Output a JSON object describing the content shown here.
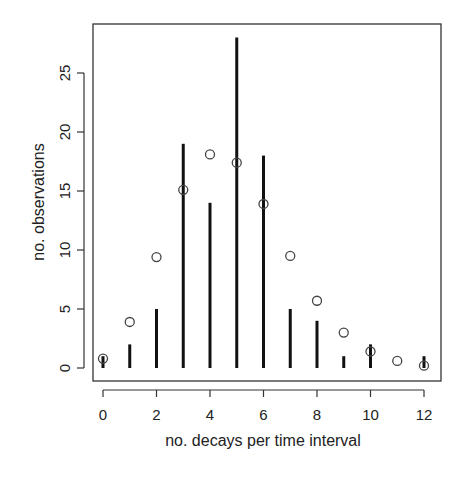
{
  "chart_data": {
    "type": "bar",
    "subtype": "histogram-lines-with-points",
    "title": "",
    "xlabel": "no. decays per time interval",
    "ylabel": "no. observations",
    "x": [
      0,
      1,
      2,
      3,
      4,
      5,
      6,
      7,
      8,
      9,
      10,
      11,
      12
    ],
    "series": [
      {
        "name": "observed",
        "style": "vertical-lines",
        "values": [
          1,
          2,
          5,
          19,
          14,
          28,
          18,
          5,
          4,
          1,
          2,
          0,
          1
        ]
      },
      {
        "name": "expected",
        "style": "open-circles",
        "values": [
          0.8,
          3.9,
          9.4,
          15.1,
          18.1,
          17.4,
          13.9,
          9.5,
          5.7,
          3.0,
          1.4,
          0.6,
          0.2
        ]
      }
    ],
    "xticks": [
      0,
      2,
      4,
      6,
      8,
      10,
      12
    ],
    "yticks": [
      0,
      5,
      10,
      15,
      20,
      25
    ],
    "xlim": [
      -0.4,
      12.6
    ],
    "ylim": [
      -1,
      29.2
    ],
    "grid": false,
    "legend": null,
    "colors": {
      "lines": "#111111",
      "points": "#444444",
      "axes": "#333333"
    }
  }
}
